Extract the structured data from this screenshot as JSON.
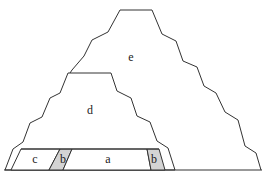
{
  "diagram": {
    "colors": {
      "stroke": "#333333",
      "background": "#ffffff",
      "shaded": "#d4d4d4"
    },
    "labels": {
      "a": "a",
      "b_left": "b",
      "b_right": "b",
      "c": "c",
      "d": "d",
      "e": "e"
    }
  }
}
